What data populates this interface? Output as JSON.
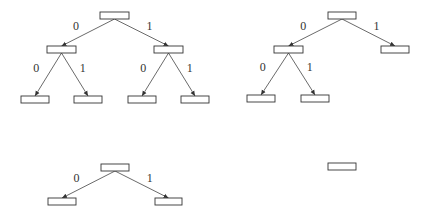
{
  "diagram": {
    "title": "",
    "trees": [
      {
        "id": "full-depth-2-tree",
        "nodes": [
          {
            "id": "root",
            "x": 100,
            "y": 12,
            "w": 29,
            "h": 7
          },
          {
            "id": "n0",
            "x": 47,
            "y": 46,
            "w": 29,
            "h": 7
          },
          {
            "id": "n1",
            "x": 154,
            "y": 46,
            "w": 29,
            "h": 7
          },
          {
            "id": "n00",
            "x": 21,
            "y": 96,
            "w": 28,
            "h": 7
          },
          {
            "id": "n01",
            "x": 74,
            "y": 96,
            "w": 28,
            "h": 7
          },
          {
            "id": "n10",
            "x": 128,
            "y": 96,
            "w": 28,
            "h": 7
          },
          {
            "id": "n11",
            "x": 181,
            "y": 96,
            "w": 28,
            "h": 7
          }
        ],
        "edges": [
          {
            "from": "root",
            "to": "n0",
            "label": "0"
          },
          {
            "from": "root",
            "to": "n1",
            "label": "1"
          },
          {
            "from": "n0",
            "to": "n00",
            "label": "0"
          },
          {
            "from": "n0",
            "to": "n01",
            "label": "1"
          },
          {
            "from": "n1",
            "to": "n10",
            "label": "0"
          },
          {
            "from": "n1",
            "to": "n11",
            "label": "1"
          }
        ]
      },
      {
        "id": "partial-tree",
        "nodes": [
          {
            "id": "root",
            "x": 328,
            "y": 12,
            "w": 28,
            "h": 7
          },
          {
            "id": "n0",
            "x": 274,
            "y": 46,
            "w": 29,
            "h": 7
          },
          {
            "id": "n1",
            "x": 381,
            "y": 46,
            "w": 28,
            "h": 7
          },
          {
            "id": "n00",
            "x": 247,
            "y": 95,
            "w": 28,
            "h": 7
          },
          {
            "id": "n01",
            "x": 301,
            "y": 95,
            "w": 28,
            "h": 7
          }
        ],
        "edges": [
          {
            "from": "root",
            "to": "n0",
            "label": "0"
          },
          {
            "from": "root",
            "to": "n1",
            "label": "1"
          },
          {
            "from": "n0",
            "to": "n00",
            "label": "0"
          },
          {
            "from": "n0",
            "to": "n01",
            "label": "1"
          }
        ]
      },
      {
        "id": "depth-1-tree",
        "nodes": [
          {
            "id": "root",
            "x": 101,
            "y": 164,
            "w": 28,
            "h": 7
          },
          {
            "id": "n0",
            "x": 48,
            "y": 198,
            "w": 28,
            "h": 7
          },
          {
            "id": "n1",
            "x": 155,
            "y": 198,
            "w": 27,
            "h": 7
          }
        ],
        "edges": [
          {
            "from": "root",
            "to": "n0",
            "label": "0"
          },
          {
            "from": "root",
            "to": "n1",
            "label": "1"
          }
        ]
      },
      {
        "id": "single-node-tree",
        "nodes": [
          {
            "id": "root",
            "x": 328,
            "y": 163,
            "w": 28,
            "h": 7
          }
        ],
        "edges": []
      }
    ],
    "colors": {
      "stroke": "#333333",
      "background": "#ffffff"
    }
  }
}
